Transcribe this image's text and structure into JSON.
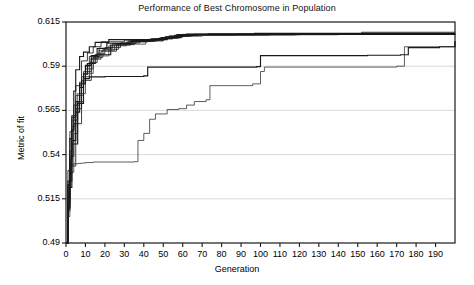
{
  "chart_data": {
    "type": "line",
    "title": "Performance of Best Chromosome in Population",
    "xlabel": "Generation",
    "ylabel": "Metric of fit",
    "xlim": [
      0,
      200
    ],
    "ylim": [
      0.49,
      0.615
    ],
    "xticks": [
      0,
      10,
      20,
      30,
      40,
      50,
      60,
      70,
      80,
      90,
      100,
      110,
      120,
      130,
      140,
      150,
      160,
      170,
      180,
      190
    ],
    "xtick_labels": [
      "0",
      "10",
      "20",
      "30",
      "40",
      "50",
      "60",
      "70",
      "80",
      "90",
      "100",
      "110",
      "120",
      "130",
      "140",
      "150",
      "160",
      "170",
      "180",
      "190"
    ],
    "yticks": [
      0.49,
      0.515,
      0.54,
      0.565,
      0.59,
      0.615
    ],
    "ytick_labels": [
      "0.49",
      "0.515",
      "0.54",
      "0.565",
      "0.59",
      "0.615"
    ],
    "grid": "horizontal",
    "legend": "none",
    "line_color": "#1a1a1a",
    "grid_color": "#c8c8c8",
    "axis_color": "#1a1a1a",
    "background": "#ffffff",
    "step_style": "post",
    "series": [
      {
        "name": "run-1",
        "x": [
          0,
          1,
          2,
          3,
          4,
          5,
          7,
          9,
          12,
          15,
          22,
          52,
          56,
          62,
          97,
          200
        ],
        "values": [
          0.49,
          0.51,
          0.535,
          0.554,
          0.576,
          0.588,
          0.5955,
          0.598,
          0.601,
          0.6035,
          0.605,
          0.6065,
          0.6075,
          0.6082,
          0.6086,
          0.6086
        ]
      },
      {
        "name": "run-2",
        "x": [
          0,
          1,
          2,
          3,
          5,
          8,
          11,
          14,
          18,
          30,
          48,
          53,
          60,
          73,
          152,
          200
        ],
        "values": [
          0.49,
          0.518,
          0.542,
          0.561,
          0.579,
          0.593,
          0.5975,
          0.601,
          0.6038,
          0.6048,
          0.606,
          0.6072,
          0.608,
          0.6084,
          0.6092,
          0.6092
        ]
      },
      {
        "name": "run-3",
        "x": [
          0,
          1,
          2,
          4,
          6,
          9,
          13,
          17,
          25,
          41,
          50,
          58,
          64,
          120,
          200
        ],
        "values": [
          0.49,
          0.505,
          0.53,
          0.552,
          0.57,
          0.587,
          0.5945,
          0.599,
          0.6025,
          0.6045,
          0.6058,
          0.607,
          0.6078,
          0.6084,
          0.6085
        ]
      },
      {
        "name": "run-4",
        "x": [
          0,
          1,
          3,
          5,
          7,
          10,
          13,
          16,
          21,
          34,
          44,
          51,
          57,
          98,
          200
        ],
        "values": [
          0.49,
          0.525,
          0.548,
          0.564,
          0.58,
          0.5905,
          0.596,
          0.6,
          0.603,
          0.6046,
          0.6055,
          0.6066,
          0.6079,
          0.6083,
          0.6084
        ]
      },
      {
        "name": "run-5",
        "x": [
          0,
          1,
          2,
          4,
          8,
          12,
          16,
          20,
          28,
          38,
          47,
          54,
          61,
          88,
          200
        ],
        "values": [
          0.49,
          0.512,
          0.539,
          0.5575,
          0.584,
          0.592,
          0.597,
          0.6005,
          0.6032,
          0.6044,
          0.6056,
          0.6068,
          0.6077,
          0.6082,
          0.6083
        ]
      },
      {
        "name": "run-6",
        "x": [
          0,
          1,
          2,
          3,
          6,
          10,
          14,
          19,
          27,
          36,
          46,
          55,
          63,
          105,
          200
        ],
        "values": [
          0.49,
          0.516,
          0.536,
          0.5595,
          0.5745,
          0.5885,
          0.595,
          0.5995,
          0.6028,
          0.6042,
          0.6054,
          0.6069,
          0.6076,
          0.6081,
          0.6082
        ]
      },
      {
        "name": "run-7",
        "x": [
          0,
          1,
          3,
          6,
          9,
          11,
          15,
          23,
          33,
          43,
          49,
          59,
          66,
          130,
          200
        ],
        "values": [
          0.49,
          0.5215,
          0.546,
          0.569,
          0.5855,
          0.5915,
          0.5965,
          0.602,
          0.604,
          0.6052,
          0.6062,
          0.6074,
          0.608,
          0.6083,
          0.6084
        ]
      },
      {
        "name": "run-8",
        "x": [
          0,
          1,
          2,
          5,
          8,
          13,
          18,
          26,
          35,
          45,
          52,
          60,
          68,
          112,
          200
        ],
        "values": [
          0.49,
          0.509,
          0.5335,
          0.566,
          0.582,
          0.594,
          0.5985,
          0.6022,
          0.6041,
          0.6053,
          0.6064,
          0.6073,
          0.6079,
          0.6082,
          0.6083
        ]
      },
      {
        "name": "run-9-low-late",
        "x": [
          0,
          1,
          2,
          3,
          4,
          6,
          8,
          10,
          14,
          35,
          37,
          40,
          43,
          46,
          52,
          58,
          62,
          66,
          72,
          74,
          96,
          100,
          102,
          170,
          174,
          200
        ],
        "values": [
          0.49,
          0.508,
          0.529,
          0.5345,
          0.5348,
          0.535,
          0.5352,
          0.5355,
          0.5358,
          0.536,
          0.548,
          0.552,
          0.56,
          0.563,
          0.5655,
          0.566,
          0.568,
          0.57,
          0.571,
          0.579,
          0.58,
          0.587,
          0.5895,
          0.59,
          0.601,
          0.604
        ]
      },
      {
        "name": "run-10-mid",
        "x": [
          0,
          1,
          2,
          3,
          5,
          7,
          9,
          12,
          20,
          40,
          42,
          98,
          100,
          155,
          172,
          176,
          192,
          200
        ],
        "values": [
          0.49,
          0.523,
          0.549,
          0.562,
          0.57,
          0.578,
          0.583,
          0.584,
          0.5842,
          0.5845,
          0.5895,
          0.5898,
          0.596,
          0.5962,
          0.5965,
          0.6005,
          0.601,
          0.6042
        ]
      },
      {
        "name": "run-11",
        "x": [
          0,
          1,
          2,
          4,
          7,
          10,
          12,
          17,
          24,
          32,
          50,
          57,
          65,
          140,
          200
        ],
        "values": [
          0.49,
          0.531,
          0.553,
          0.568,
          0.581,
          0.59,
          0.5955,
          0.6002,
          0.6029,
          0.6043,
          0.6059,
          0.6071,
          0.6078,
          0.6081,
          0.6082
        ]
      },
      {
        "name": "run-12",
        "x": [
          0,
          1,
          2,
          3,
          5,
          9,
          14,
          22,
          31,
          42,
          51,
          56,
          70,
          118,
          200
        ],
        "values": [
          0.49,
          0.514,
          0.5375,
          0.556,
          0.5735,
          0.586,
          0.5958,
          0.6015,
          0.6037,
          0.605,
          0.6061,
          0.607,
          0.6077,
          0.608,
          0.6081
        ]
      }
    ]
  },
  "layout": {
    "plot_left": 66,
    "plot_top": 22,
    "plot_right": 455,
    "plot_bottom": 243,
    "width": 474,
    "height": 285
  }
}
